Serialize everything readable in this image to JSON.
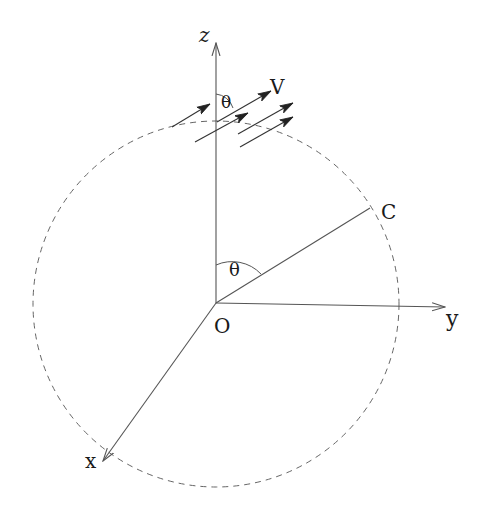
{
  "diagram": {
    "colors": {
      "line": "#555555",
      "text": "#1a1a1a",
      "dashed": "#666666"
    },
    "labels": {
      "z_axis": "z",
      "y_axis": "y",
      "x_axis": "x",
      "origin": "O",
      "point_c": "C",
      "velocity": "V",
      "angle_center": "θ",
      "angle_top": "θ"
    },
    "elements": {
      "circle": {
        "cx": 216,
        "cy": 303,
        "r": 183,
        "style": "dashed"
      },
      "axes": [
        {
          "name": "z",
          "from": [
            216,
            303
          ],
          "to": [
            216,
            42
          ]
        },
        {
          "name": "y",
          "from": [
            216,
            303
          ],
          "to": [
            446,
            307
          ]
        },
        {
          "name": "x",
          "from": [
            216,
            303
          ],
          "to": [
            102,
            462
          ]
        }
      ],
      "segment_OC": {
        "from": [
          216,
          303
        ],
        "to": [
          370,
          208
        ]
      },
      "velocity_arrows": 5
    }
  }
}
